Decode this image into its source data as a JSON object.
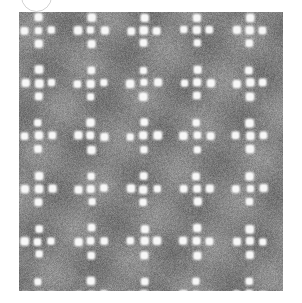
{
  "page": {
    "width": 302,
    "height": 303,
    "background_color": "#ffffff"
  },
  "arc_mark": {
    "name": "partial-circle-outline",
    "description": "faint light grey circular outline clipped by the top edge of the canvas",
    "left": 21,
    "top": -19,
    "width": 31,
    "height": 31,
    "stroke_color": "#d2d2d2",
    "stroke_width": 1.6
  },
  "figure": {
    "name": "micrograph-image",
    "left": 19,
    "top": 12,
    "width": 264,
    "height": 279,
    "background_color": "#838383",
    "noise": {
      "mean_gray": "#838383",
      "dark_speckle": "#2b2b2b",
      "light_speckle": "#c9c9c9",
      "grain_amplitude": 62
    },
    "spots": {
      "color": "#f7f7f7",
      "halo_color": "#bdbdbd",
      "radius_px": 4.1,
      "softness_px": 2.4,
      "lattice_pitch_x": 13.2,
      "lattice_pitch_y": 13.2,
      "supercell_cols": 4,
      "supercell_rows": 4,
      "motif": "plus",
      "motif_description": "within each 4x4 supercell a centre spot plus its four edge neighbours are bright; corner sites are dark",
      "origin_x": 6.0,
      "origin_y": 5.0,
      "jitter_px": 1.0
    }
  }
}
